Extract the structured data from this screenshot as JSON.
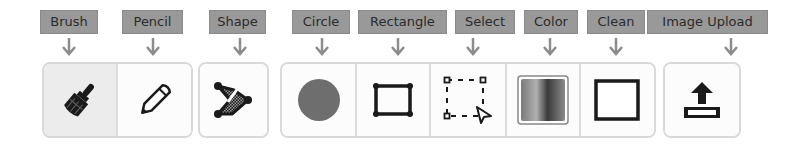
{
  "toolbar": {
    "labels": {
      "brush": "Brush",
      "pencil": "Pencil",
      "shape": "Shape",
      "circle": "Circle",
      "rectangle": "Rectangle",
      "select": "Select",
      "color": "Color",
      "clean": "Clean",
      "image_upload": "Image Upload"
    },
    "active_tool": "brush",
    "colors": {
      "label_bg": "#999999",
      "label_text": "#2b2b2b",
      "arrow": "#8c8c8c",
      "icon": "#1a1a1a",
      "circle_fill": "#6e6e6e",
      "button_border": "#d9d9d9"
    },
    "icons": {
      "brush": "paintbrush-icon",
      "pencil": "pencil-icon",
      "shape": "polygon-shape-icon",
      "circle": "filled-circle-icon",
      "rectangle": "rectangle-icon",
      "select": "marquee-select-icon",
      "color": "color-swatch-icon",
      "clean": "empty-square-icon",
      "image_upload": "upload-icon"
    }
  }
}
